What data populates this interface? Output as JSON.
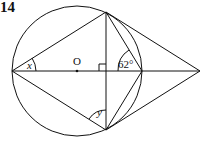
{
  "question_number": "14",
  "labels": {
    "center": "O",
    "angle_x": "x",
    "angle_y": "y",
    "angle_given": "62°"
  },
  "geometry": {
    "circle": {
      "cx": 77,
      "cy": 71,
      "r": 65
    },
    "points": {
      "left": [
        12,
        71
      ],
      "top": [
        106,
        12
      ],
      "bottom": [
        106,
        130
      ],
      "right_circle": [
        142,
        71
      ],
      "far_right": [
        200,
        71
      ],
      "center": [
        77,
        71
      ]
    }
  },
  "colors": {
    "stroke": "#111111",
    "background": "#ffffff"
  }
}
